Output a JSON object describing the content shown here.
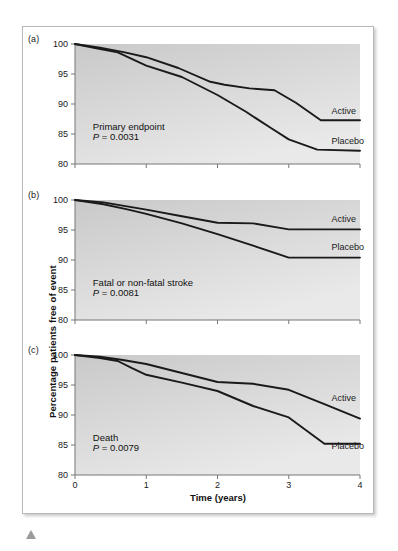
{
  "figure": {
    "y_axis_label": "Percentage patients free of event",
    "x_axis_label": "Time (years)",
    "panel_labels": [
      "(a)",
      "(b)",
      "(c)"
    ],
    "series_names": [
      "Active",
      "Placebo"
    ],
    "line_color": "#1a1a1a",
    "plot_bg_top": "#c9c9c9",
    "plot_bg_bottom": "#e9e9e9",
    "frame_border": "#b9b9b9"
  },
  "chart_data": [
    {
      "type": "line",
      "panel": "(a)",
      "title": "Primary endpoint",
      "annotation_p": "P = 0.0031",
      "xlabel": "Time (years)",
      "ylabel": "Percentage patients free of event",
      "xlim": [
        0,
        4
      ],
      "ylim": [
        80,
        100
      ],
      "xticks": [
        0,
        1,
        2,
        3,
        4
      ],
      "yticks": [
        80,
        85,
        90,
        95,
        100
      ],
      "grid": false,
      "legend_position": "right-inline",
      "series": [
        {
          "name": "Active",
          "label_x": 3.6,
          "label_y": 88.3,
          "x": [
            0,
            0.35,
            0.7,
            1.0,
            1.45,
            1.9,
            2.1,
            2.45,
            2.8,
            3.1,
            3.45,
            4.0
          ],
          "values": [
            100.0,
            99.4,
            98.6,
            97.8,
            96.0,
            93.7,
            93.2,
            92.6,
            92.3,
            90.2,
            87.3,
            87.3
          ]
        },
        {
          "name": "Placebo",
          "label_x": 3.6,
          "label_y": 83.3,
          "x": [
            0,
            0.3,
            0.6,
            1.0,
            1.5,
            2.0,
            2.4,
            2.75,
            3.0,
            3.4,
            4.0
          ],
          "values": [
            100.0,
            99.3,
            98.6,
            96.4,
            94.5,
            91.5,
            88.7,
            86.0,
            84.1,
            82.4,
            82.2
          ]
        }
      ]
    },
    {
      "type": "line",
      "panel": "(b)",
      "title": "Fatal or non-fatal stroke",
      "annotation_p": "P = 0.0081",
      "xlabel": "Time (years)",
      "ylabel": "Percentage patients free of event",
      "xlim": [
        0,
        4
      ],
      "ylim": [
        80,
        100
      ],
      "xticks": [
        0,
        1,
        2,
        3,
        4
      ],
      "yticks": [
        80,
        85,
        90,
        95,
        100
      ],
      "grid": false,
      "legend_position": "right-inline",
      "series": [
        {
          "name": "Active",
          "label_x": 3.6,
          "label_y": 96.4,
          "x": [
            0,
            0.4,
            0.75,
            1.0,
            1.5,
            2.0,
            2.5,
            3.0,
            4.0
          ],
          "values": [
            100.0,
            99.6,
            98.9,
            98.4,
            97.3,
            96.2,
            96.1,
            95.1,
            95.1
          ]
        },
        {
          "name": "Placebo",
          "label_x": 3.6,
          "label_y": 91.7,
          "x": [
            0,
            0.4,
            0.75,
            1.0,
            1.5,
            2.0,
            2.5,
            3.0,
            4.0
          ],
          "values": [
            100.0,
            99.3,
            98.4,
            97.7,
            96.1,
            94.3,
            92.4,
            90.4,
            90.4
          ]
        }
      ]
    },
    {
      "type": "line",
      "panel": "(c)",
      "title": "Death",
      "annotation_p": "P = 0.0079",
      "xlabel": "Time (years)",
      "ylabel": "Percentage patients free of event",
      "xlim": [
        0,
        4
      ],
      "ylim": [
        80,
        100
      ],
      "xticks": [
        0,
        1,
        2,
        3,
        4
      ],
      "yticks": [
        80,
        85,
        90,
        95,
        100
      ],
      "grid": false,
      "legend_position": "right-inline",
      "series": [
        {
          "name": "Active",
          "label_x": 3.6,
          "label_y": 92.3,
          "x": [
            0,
            0.35,
            0.65,
            1.0,
            1.5,
            2.0,
            2.5,
            3.0,
            3.5,
            4.0
          ],
          "values": [
            100.0,
            99.7,
            99.2,
            98.5,
            97.0,
            95.5,
            95.2,
            94.2,
            91.8,
            89.4
          ]
        },
        {
          "name": "Placebo",
          "label_x": 3.6,
          "label_y": 84.3,
          "x": [
            0,
            0.35,
            0.6,
            0.8,
            1.0,
            1.5,
            2.0,
            2.5,
            3.0,
            3.5,
            4.0
          ],
          "values": [
            100.0,
            99.5,
            99.0,
            97.8,
            96.7,
            95.4,
            94.0,
            91.5,
            89.6,
            85.2,
            85.2
          ]
        }
      ]
    }
  ]
}
